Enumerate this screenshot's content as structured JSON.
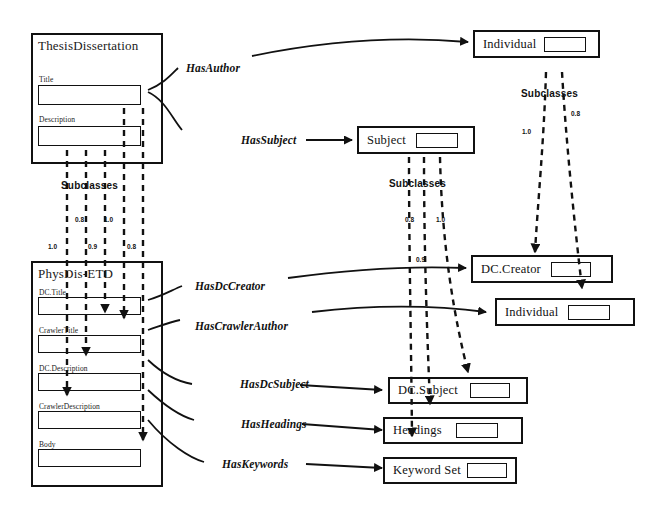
{
  "diagram": {
    "stroke_color": "#111111",
    "background_color": "#ffffff"
  },
  "classes": [
    {
      "id": "thesis-dissertation",
      "label": "ThesisDissertation",
      "fields": [
        {
          "label": "Title"
        },
        {
          "label": "Description"
        }
      ]
    },
    {
      "id": "physdis-etd",
      "label": "PhysDis-ETD",
      "fields": [
        {
          "label": "DC.Title"
        },
        {
          "label": "CrawlerTitle"
        },
        {
          "label": "DC.Description"
        },
        {
          "label": "CrawlerDescription"
        },
        {
          "label": "Body"
        }
      ]
    }
  ],
  "entities": [
    {
      "id": "individual-top",
      "label": "Individual"
    },
    {
      "id": "subject",
      "label": "Subject"
    },
    {
      "id": "dc-creator",
      "label": "DC.Creator"
    },
    {
      "id": "individual-bottom",
      "label": "Individual"
    },
    {
      "id": "dc-subject",
      "label": "DC.Subject"
    },
    {
      "id": "headings",
      "label": "Headings"
    },
    {
      "id": "keyword-set",
      "label": "Keyword Set"
    }
  ],
  "relations": [
    {
      "id": "has-author",
      "label": "HasAuthor"
    },
    {
      "id": "has-subject",
      "label": "HasSubject"
    },
    {
      "id": "has-dc-creator",
      "label": "HasDcCreator"
    },
    {
      "id": "has-crawler-author",
      "label": "HasCrawlerAuthor"
    },
    {
      "id": "has-dc-subject",
      "label": "HasDcSubject"
    },
    {
      "id": "has-headings",
      "label": "HasHeadings"
    },
    {
      "id": "has-keywords",
      "label": "HasKeywords"
    }
  ],
  "subclass_groups": [
    {
      "id": "subclasses-left",
      "label": "Subclasses",
      "weights": [
        "0.8",
        "1.0",
        "1.0",
        "0.9",
        "0.8"
      ]
    },
    {
      "id": "subclasses-middle",
      "label": "Subclasses",
      "weights": [
        "0.8",
        "1.0",
        "0.9"
      ]
    },
    {
      "id": "subclasses-right",
      "label": "Subclasses",
      "weights": [
        "1.0",
        "0.8"
      ]
    }
  ],
  "weights": {
    "left_upper_a": "0.8",
    "left_upper_b": "1.0",
    "left_lower_a": "1.0",
    "left_lower_b": "0.9",
    "left_lower_c": "0.8",
    "mid_a": "0.8",
    "mid_b": "1.0",
    "mid_c": "0.9",
    "right_a": "1.0",
    "right_b": "0.8"
  }
}
